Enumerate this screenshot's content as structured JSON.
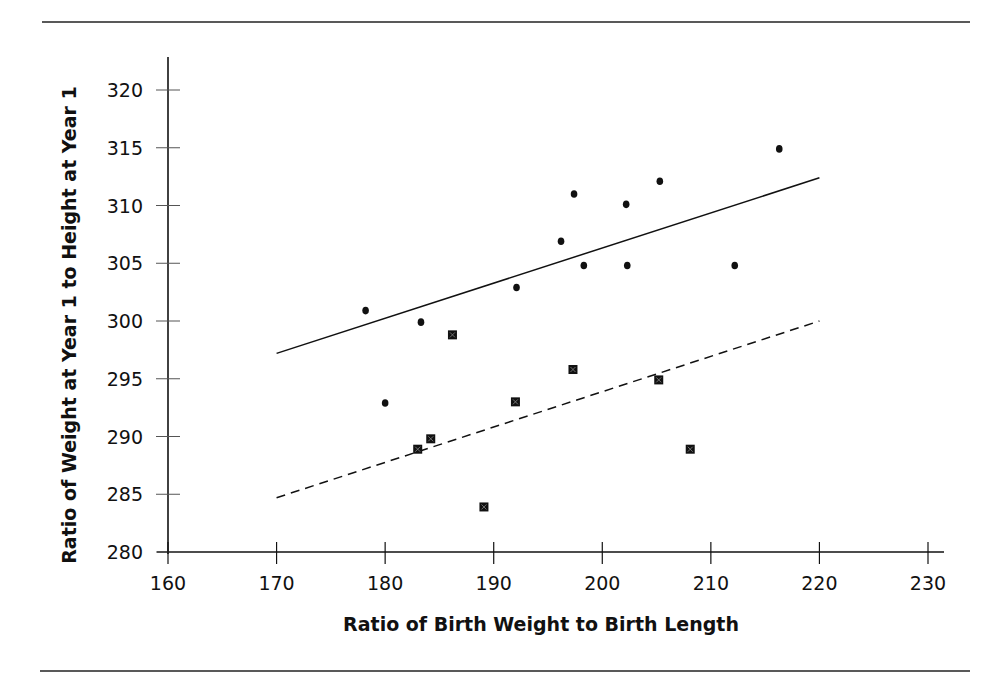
{
  "chart_data": {
    "type": "scatter",
    "title": "",
    "xlabel": "Ratio of Birth Weight to Birth Length",
    "ylabel": "Ratio of Weight at Year 1 to Height at Year 1",
    "xlim": [
      160,
      230
    ],
    "ylim": [
      280,
      320
    ],
    "xticks": [
      160,
      170,
      180,
      190,
      200,
      210,
      220,
      230
    ],
    "yticks": [
      280,
      285,
      290,
      295,
      300,
      305,
      310,
      315,
      320
    ],
    "grid": false,
    "legend": null,
    "series": [
      {
        "name": "circles",
        "marker": "circle",
        "points": [
          [
            178.2,
            300.9
          ],
          [
            180.0,
            292.9
          ],
          [
            183.3,
            299.9
          ],
          [
            192.1,
            302.9
          ],
          [
            196.2,
            306.9
          ],
          [
            197.4,
            311.0
          ],
          [
            198.3,
            304.8
          ],
          [
            202.2,
            310.1
          ],
          [
            202.3,
            304.8
          ],
          [
            205.3,
            312.1
          ],
          [
            212.2,
            304.8
          ],
          [
            216.3,
            314.9
          ]
        ],
        "trendline": {
          "style": "solid",
          "from": [
            170,
            297.2
          ],
          "to": [
            220,
            312.4
          ]
        }
      },
      {
        "name": "squares",
        "marker": "square",
        "points": [
          [
            183.0,
            288.9
          ],
          [
            184.2,
            289.8
          ],
          [
            186.2,
            298.8
          ],
          [
            189.1,
            283.9
          ],
          [
            192.0,
            293.0
          ],
          [
            197.3,
            295.8
          ],
          [
            205.2,
            294.9
          ],
          [
            208.1,
            288.9
          ]
        ],
        "trendline": {
          "style": "dashed",
          "from": [
            170,
            284.7
          ],
          "to": [
            220,
            300.0
          ]
        }
      }
    ]
  },
  "layout": {
    "plot": {
      "x0px": 168,
      "x1px": 928,
      "xmin": 160,
      "xmax": 230,
      "y0px": 552,
      "y1px": 90,
      "ymin": 280,
      "ymax": 320
    },
    "colors": {
      "ink": "#111111",
      "background": "#ffffff"
    }
  }
}
